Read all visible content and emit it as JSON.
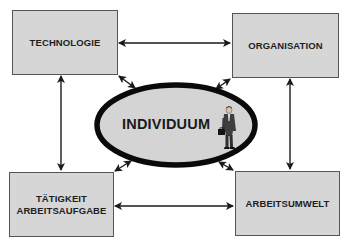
{
  "diagram": {
    "center": {
      "label": "INDIVIDUUM",
      "icon": "businessman-icon"
    },
    "boxes": {
      "top_left": {
        "label": "TECHNOLOGIE"
      },
      "top_right": {
        "label": "ORGANISATION"
      },
      "bottom_left": {
        "line1": "TÄTIGKEIT",
        "line2": "ARBEITSAUFGABE"
      },
      "bottom_right": {
        "label": "ARBEITSUMWELT"
      }
    },
    "connections": [
      {
        "from": "TECHNOLOGIE",
        "to": "ORGANISATION",
        "type": "bidirectional"
      },
      {
        "from": "TECHNOLOGIE",
        "to": "TÄTIGKEIT ARBEITSAUFGABE",
        "type": "bidirectional"
      },
      {
        "from": "ORGANISATION",
        "to": "ARBEITSUMWELT",
        "type": "bidirectional"
      },
      {
        "from": "TÄTIGKEIT ARBEITSAUFGABE",
        "to": "ARBEITSUMWELT",
        "type": "bidirectional"
      },
      {
        "from": "INDIVIDUUM",
        "to": "TECHNOLOGIE",
        "type": "bidirectional"
      },
      {
        "from": "INDIVIDUUM",
        "to": "ORGANISATION",
        "type": "bidirectional"
      },
      {
        "from": "INDIVIDUUM",
        "to": "TÄTIGKEIT ARBEITSAUFGABE",
        "type": "bidirectional"
      },
      {
        "from": "INDIVIDUUM",
        "to": "ARBEITSUMWELT",
        "type": "bidirectional"
      }
    ],
    "colors": {
      "box_fill": "#d6d6d6",
      "box_border": "#555555",
      "ellipse_fill": "#d4d4d4",
      "ellipse_border": "#0a0a0a",
      "arrow": "#1a1a1a",
      "text": "#1e1e1e"
    }
  }
}
